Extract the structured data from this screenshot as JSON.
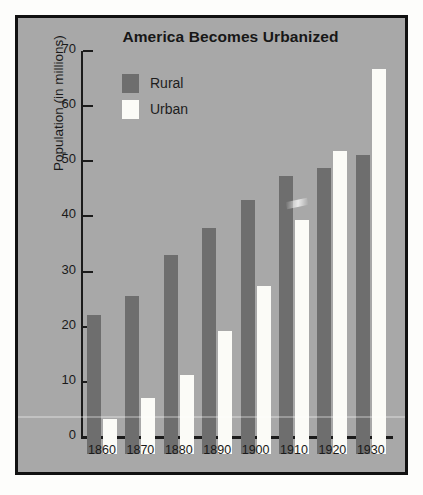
{
  "figure": {
    "background_color": "#fdfdfb",
    "panel_color": "#a8a8a8",
    "border_color": "#111111"
  },
  "chart_data": {
    "type": "bar",
    "title": "America Becomes Urbanized",
    "xlabel": "",
    "ylabel": "Population (in millions)",
    "categories": [
      "1860",
      "1870",
      "1880",
      "1890",
      "1900",
      "1910",
      "1920",
      "1930"
    ],
    "series": [
      {
        "name": "Rural",
        "color": "#6e6e6e",
        "values": [
          25.3,
          28.7,
          36.1,
          41.0,
          46.0,
          50.4,
          51.8,
          54.3
        ]
      },
      {
        "name": "Urban",
        "color": "#fbfbf7",
        "values": [
          6.4,
          10.2,
          14.4,
          22.3,
          30.4,
          42.4,
          54.9,
          69.9
        ]
      }
    ],
    "ylim": [
      0,
      70
    ],
    "yticks": [
      0,
      10,
      20,
      30,
      40,
      50,
      60,
      70
    ],
    "ytick_labels": [
      "0",
      "10",
      "20",
      "30",
      "40",
      "50",
      "60",
      "70"
    ],
    "grid": false,
    "legend_position": "upper-left-inside"
  }
}
